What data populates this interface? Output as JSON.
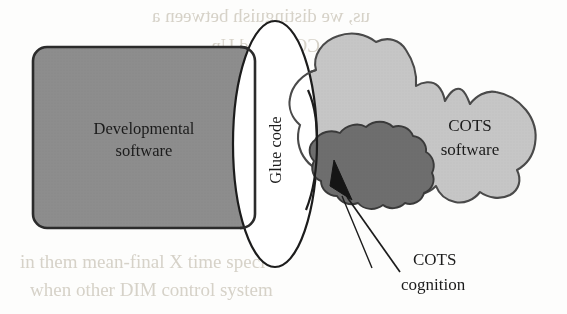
{
  "figure": {
    "background_color": "#fdfdfc"
  },
  "shapes": {
    "developmental_software": {
      "name": "Developmental software",
      "label_line1": "Developmental",
      "label_line2": "software",
      "shape": "rounded-rectangle",
      "fill_color": "#8d8d8d",
      "stroke_color": "#2b2b2b",
      "x": 33,
      "y": 47,
      "width": 222,
      "height": 181,
      "corner_radius": 14
    },
    "glue_code": {
      "name": "Glue code",
      "label": "Glue code",
      "shape": "ellipse",
      "fill_color": "#ffffff",
      "stroke_color": "#1c1c1c",
      "center_x": 275,
      "center_y": 144,
      "rx": 42,
      "ry": 123,
      "text_rotation_deg": -90
    },
    "cots_software": {
      "name": "COTS software",
      "label_line1": "COTS",
      "label_line2": "software",
      "shape": "irregular-blob",
      "fill_color": "#c6c6c6",
      "stroke_color": "#4a4a4a"
    },
    "cots_cognition": {
      "name": "COTS cognition",
      "label_line1": "COTS",
      "label_line2": "cognition",
      "shape": "irregular-blob",
      "fill_color": "#6e6e6e",
      "stroke_color": "#3a3a3a"
    }
  },
  "annotations": {
    "cots_cognition_callout": {
      "label_line1": "COTS",
      "label_line2": "cognition",
      "has_arrow": true,
      "arrow_target": "cots-cognition-blob",
      "leader_from_x": 400,
      "leader_from_y": 272,
      "leader_to_x": 348,
      "leader_to_y": 196
    }
  },
  "scan_bleed_through": {
    "visible": true,
    "description": "faint mirrored text from reverse page",
    "top_fragments": [
      "ish on and",
      "us, we distinguish between a",
      "COTS and Un"
    ],
    "bottom_fragments": [
      "in them mean-final X time speci",
      "when other DIM control system",
      "the value to be defined by the t"
    ]
  }
}
